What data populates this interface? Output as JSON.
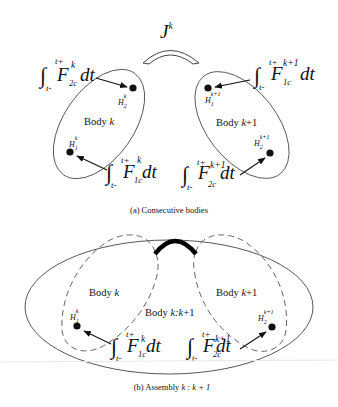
{
  "figure_a": {
    "caption": "(a)  Consecutive bodies",
    "joint_label": "J",
    "joint_sup": "k",
    "body_left": {
      "label_prefix": "Body ",
      "label_var": "k",
      "point_top": {
        "name": "H",
        "sub": "2",
        "sup": "k"
      },
      "point_bottom": {
        "name": "H",
        "sub": "1",
        "sup": "k"
      },
      "impulse_top": {
        "lower": "t-",
        "upper": "t+",
        "F": "F",
        "sub": "2c",
        "sup": "k",
        "dt": "dt"
      },
      "impulse_bottom": {
        "lower": "t-",
        "upper": "t+",
        "F": "F",
        "sub": "1c",
        "sup": "k",
        "dt": "dt"
      }
    },
    "body_right": {
      "label_prefix": "Body ",
      "label_var": "k",
      "label_suffix": "+1",
      "point_top": {
        "name": "H",
        "sub": "1",
        "sup": "k+1"
      },
      "point_bottom": {
        "name": "H",
        "sub": "2",
        "sup": "k+1"
      },
      "impulse_top": {
        "lower": "t-",
        "upper": "t+",
        "F": "F",
        "sub": "1c",
        "sup": "k+1",
        "dt": "dt"
      },
      "impulse_bottom": {
        "lower": "t-",
        "upper": "t+",
        "F": "F",
        "sub": "2c",
        "sup": "k+1",
        "dt": "dt"
      }
    }
  },
  "figure_b": {
    "caption_prefix": "(b)  Assembly ",
    "caption_math": "k : k + 1",
    "assembly_label_prefix": "Body ",
    "assembly_label_var": "k:k",
    "assembly_label_suffix": "+1",
    "body_left": {
      "label_prefix": "Body ",
      "label_var": "k",
      "point": {
        "name": "H",
        "sub": "1",
        "sup": "k"
      },
      "impulse": {
        "lower": "t-",
        "upper": "t+",
        "F": "F",
        "sub": "1c",
        "sup": "k",
        "dt": "dt"
      }
    },
    "body_right": {
      "label_prefix": "Body ",
      "label_var": "k",
      "label_suffix": "+1",
      "point": {
        "name": "H",
        "sub": "2",
        "sup": "k+1"
      },
      "impulse": {
        "lower": "t-",
        "upper": "t+",
        "F": "F",
        "sub": "2c",
        "sup": "k+1",
        "dt": "dt"
      }
    }
  },
  "colors": {
    "stroke": "#333333",
    "ink": "#111111",
    "background": "#ffffff"
  }
}
